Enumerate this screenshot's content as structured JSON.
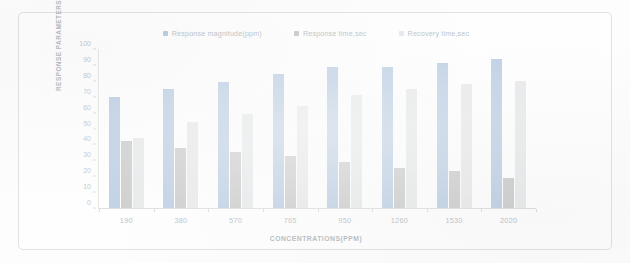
{
  "chart_data": {
    "type": "bar",
    "title": "",
    "subtitle": "",
    "xlabel": "CONCENTRATIONS(PPM)",
    "ylabel": "RESPONSE PARAMETERS",
    "categories": [
      "190",
      "380",
      "570",
      "765",
      "950",
      "1260",
      "1530",
      "2020"
    ],
    "ylim": [
      0,
      100
    ],
    "yticks": [
      "100",
      "90",
      "80",
      "70",
      "60",
      "50",
      "40",
      "30",
      "20",
      "10",
      "0"
    ],
    "ytick_values": [
      100,
      90,
      80,
      70,
      60,
      50,
      40,
      30,
      20,
      10,
      0
    ],
    "grid": false,
    "legend_position": "top-center",
    "series": [
      {
        "name": "Response magnitude(ppm)",
        "color": "#7c9fc9",
        "values": [
          70,
          75,
          79,
          84,
          89,
          89,
          91,
          94
        ]
      },
      {
        "name": "Response time,sec",
        "color": "#9a9a9a",
        "values": [
          42,
          38,
          35,
          33,
          29,
          25,
          23,
          19
        ]
      },
      {
        "name": "Recovery time,sec",
        "color": "#cfd3d6",
        "values": [
          44,
          54,
          59,
          64,
          71,
          75,
          78,
          80
        ]
      }
    ]
  },
  "legend": {
    "items": [
      {
        "label": "Response magnitude(ppm)",
        "marker": "square-marker"
      },
      {
        "label": "Response time,sec",
        "marker": "square-marker"
      },
      {
        "label": "Recovery time,sec",
        "marker": "square-marker"
      }
    ]
  },
  "axes": {
    "y_title": "RESPONSE PARAMETERS",
    "x_title": "CONCENTRATIONS(PPM)"
  }
}
